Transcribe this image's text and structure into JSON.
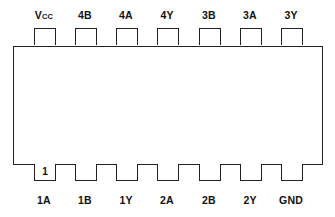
{
  "diagram": {
    "type": "ic-pinout",
    "package": "14-pin DIP",
    "top_pins": [
      {
        "pin": 14,
        "label": "V",
        "sub": "CC"
      },
      {
        "pin": 13,
        "label": "4B",
        "sub": ""
      },
      {
        "pin": 12,
        "label": "4A",
        "sub": ""
      },
      {
        "pin": 11,
        "label": "4Y",
        "sub": ""
      },
      {
        "pin": 10,
        "label": "3B",
        "sub": ""
      },
      {
        "pin": 9,
        "label": "3A",
        "sub": ""
      },
      {
        "pin": 8,
        "label": "3Y",
        "sub": ""
      }
    ],
    "bottom_pins": [
      {
        "pin": 1,
        "label": "1A",
        "marker": "1"
      },
      {
        "pin": 2,
        "label": "1B",
        "marker": ""
      },
      {
        "pin": 3,
        "label": "1Y",
        "marker": ""
      },
      {
        "pin": 4,
        "label": "2A",
        "marker": ""
      },
      {
        "pin": 5,
        "label": "2B",
        "marker": ""
      },
      {
        "pin": 6,
        "label": "2Y",
        "marker": ""
      },
      {
        "pin": 7,
        "label": "GND",
        "marker": ""
      }
    ]
  }
}
